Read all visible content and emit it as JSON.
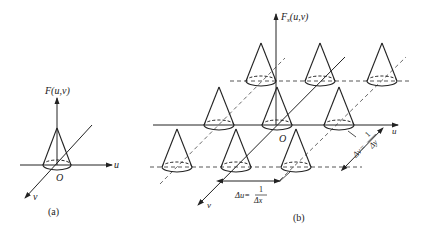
{
  "figure_a": {
    "axis_vertical_label": "F(u,v)",
    "axis_u_label": "u",
    "axis_v_label": "v",
    "origin_label": "O",
    "caption": "(a)"
  },
  "figure_b": {
    "axis_vertical_label_main": "F",
    "axis_vertical_label_sub": "s",
    "axis_vertical_label_args": "(u,v)",
    "axis_u_label": "u",
    "axis_v_label": "v",
    "origin_label": "O",
    "delta_u_label": "Δu=",
    "delta_u_num": "1",
    "delta_u_den": "Δx",
    "delta_v_label": "Δv=",
    "delta_v_num": "1",
    "delta_v_den": "Δy",
    "caption": "(b)",
    "cone_rows": [
      {
        "row": "top",
        "count": 3
      },
      {
        "row": "middle",
        "count": 3
      },
      {
        "row": "bottom",
        "count": 3
      }
    ]
  },
  "colors": {
    "line": "#222222",
    "dashed": "#444444",
    "background": "#ffffff"
  }
}
